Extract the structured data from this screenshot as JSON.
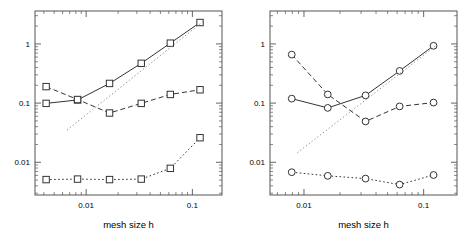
{
  "figure": {
    "panels": [
      "left",
      "right"
    ],
    "background": "#ffffff",
    "line_color": "#333333",
    "axis_color": "#555555",
    "reference_line_color": "#888888"
  },
  "axis": {
    "xlabel": "mesh size h",
    "x_tick_labels": [
      "0.01",
      "0.1"
    ],
    "x_tick_values": [
      0.01,
      0.1
    ],
    "y_tick_labels": [
      "1",
      "0.1",
      "0.01"
    ],
    "y_tick_values": [
      1,
      0.1,
      0.01
    ],
    "xscale": "log",
    "yscale": "log",
    "xlim": [
      0.0033,
      0.19
    ],
    "ylim": [
      0.0028,
      3.6
    ],
    "grid": "off",
    "legend": "none"
  },
  "chart_data": [
    {
      "type": "line",
      "panel": "left",
      "title": "",
      "xlabel": "mesh size h",
      "ylabel": "",
      "xscale": "log",
      "yscale": "log",
      "xlim": [
        0.0033,
        0.19
      ],
      "ylim": [
        0.0028,
        3.6
      ],
      "grid": false,
      "legend_position": "none",
      "marker": "square",
      "series": [
        {
          "name": "solid-rising",
          "style": "solid",
          "marker": "square",
          "x": [
            0.0042,
            0.0083,
            0.0166,
            0.033,
            0.062,
            0.118
          ],
          "y": [
            0.099,
            0.113,
            0.215,
            0.47,
            1.03,
            2.3
          ]
        },
        {
          "name": "dashed-dipping",
          "style": "dashed",
          "marker": "square",
          "x": [
            0.0042,
            0.0083,
            0.0166,
            0.033,
            0.062,
            0.118
          ],
          "y": [
            0.19,
            0.115,
            0.068,
            0.099,
            0.14,
            0.168
          ]
        },
        {
          "name": "dotted-low",
          "style": "dotted",
          "marker": "square",
          "x": [
            0.0042,
            0.0083,
            0.0166,
            0.033,
            0.062,
            0.118
          ],
          "y": [
            0.0051,
            0.0052,
            0.0051,
            0.0052,
            0.0079,
            0.026
          ]
        },
        {
          "name": "reference-slope",
          "style": "dotted",
          "marker": "none",
          "x": [
            0.0066,
            0.128
          ],
          "y": [
            0.035,
            2.45
          ]
        }
      ]
    },
    {
      "type": "line",
      "panel": "right",
      "title": "",
      "xlabel": "mesh size h",
      "ylabel": "",
      "xscale": "log",
      "yscale": "log",
      "xlim": [
        0.0052,
        0.19
      ],
      "ylim": [
        0.0028,
        3.6
      ],
      "grid": false,
      "legend_position": "none",
      "marker": "circle",
      "series": [
        {
          "name": "solid-rising",
          "style": "solid",
          "marker": "circle",
          "x": [
            0.0079,
            0.0158,
            0.0327,
            0.063,
            0.121
          ],
          "y": [
            0.119,
            0.083,
            0.135,
            0.35,
            0.93
          ]
        },
        {
          "name": "dashed-dipping",
          "style": "dashed",
          "marker": "circle",
          "x": [
            0.0079,
            0.0158,
            0.0327,
            0.063,
            0.121
          ],
          "y": [
            0.66,
            0.14,
            0.049,
            0.088,
            0.102
          ]
        },
        {
          "name": "dotted-low",
          "style": "dotted",
          "marker": "circle",
          "x": [
            0.0079,
            0.0158,
            0.0327,
            0.063,
            0.121
          ],
          "y": [
            0.0068,
            0.0059,
            0.0053,
            0.0042,
            0.0061
          ]
        },
        {
          "name": "reference-slope",
          "style": "dotted",
          "marker": "none",
          "x": [
            0.0088,
            0.128
          ],
          "y": [
            0.0145,
            0.95
          ]
        }
      ]
    }
  ]
}
